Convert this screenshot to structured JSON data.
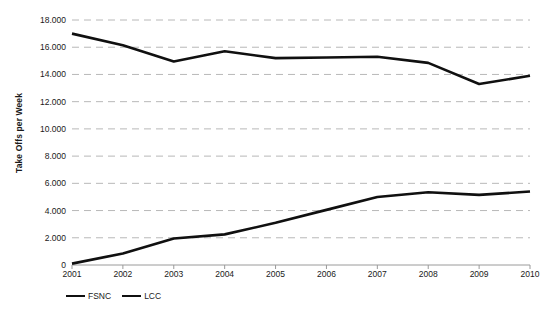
{
  "chart_data": {
    "type": "line",
    "title": "",
    "subtitle": "",
    "xlabel": "",
    "ylabel": "Take Offs per Week",
    "x": [
      "2001",
      "2002",
      "2003",
      "2004",
      "2005",
      "2006",
      "2007",
      "2008",
      "2009",
      "2010"
    ],
    "categories": [
      "2001",
      "2002",
      "2003",
      "2004",
      "2005",
      "2006",
      "2007",
      "2008",
      "2009",
      "2010"
    ],
    "series": [
      {
        "name": "FSNC",
        "color": "#101010",
        "line_width": 2.6,
        "values": [
          17000,
          16150,
          14950,
          15700,
          15200,
          15250,
          15300,
          14850,
          13300,
          13900
        ]
      },
      {
        "name": "LCC",
        "color": "#101010",
        "line_width": 2.6,
        "values": [
          100,
          850,
          1950,
          2250,
          3100,
          4050,
          5000,
          5350,
          5150,
          5400
        ]
      }
    ],
    "ylim": [
      0,
      18000
    ],
    "ytick_values": [
      0,
      2000,
      4000,
      6000,
      8000,
      10000,
      12000,
      14000,
      16000,
      18000
    ],
    "ytick_labels": [
      "0",
      "2.000",
      "4.000",
      "6.000",
      "8.000",
      "10.000",
      "12.000",
      "14.000",
      "16.000",
      "18.000"
    ],
    "grid": {
      "horizontal": true,
      "vertical": false,
      "style": "dashed",
      "color": "#b8b8b8"
    },
    "axis_line_color": "#9a9a9a",
    "background_color": "#ffffff",
    "legend": {
      "position": "bottom-left",
      "entries": [
        {
          "label": "FSNC",
          "color": "#101010"
        },
        {
          "label": "LCC",
          "color": "#101010"
        }
      ]
    }
  }
}
